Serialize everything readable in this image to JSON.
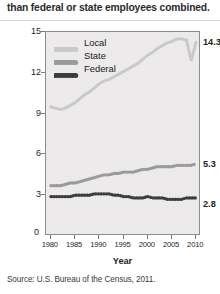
{
  "header": {
    "text": "than federal or state employees combined."
  },
  "source": {
    "text": "Source: U.S. Bureau of the Census, 2011."
  },
  "legend": {
    "items": [
      {
        "label": "Local",
        "color": "#c9c9c9"
      },
      {
        "label": "State",
        "color": "#9a9a9a"
      },
      {
        "label": "Federal",
        "color": "#3d3d3d"
      }
    ]
  },
  "axes": {
    "y_label": "Number of Employees (in millions)",
    "x_label": "Year",
    "y_ticks": [
      "15",
      "12",
      "9",
      "6",
      "3"
    ],
    "zero_label": "0",
    "x_ticks": [
      "1980",
      "1985",
      "1990",
      "1995",
      "2000",
      "2005",
      "2010"
    ]
  },
  "end_labels": {
    "local": "14.3",
    "state": "5.3",
    "federal": "2.8"
  },
  "colors": {
    "plot_background": "#eceaea",
    "plot_border": "#8d8d8d",
    "local": "#c9c9c9",
    "state": "#9a9a9a",
    "federal": "#3d3d3d",
    "page_background": "#ffffff",
    "text": "#231f20"
  },
  "chart_data": {
    "type": "line",
    "title": "",
    "xlabel": "Year",
    "ylabel": "Number of Employees (in millions)",
    "xlim": [
      1979,
      2011
    ],
    "ylim": [
      0,
      15
    ],
    "y_ticks": [
      3,
      6,
      9,
      12,
      15
    ],
    "x_ticks": [
      1980,
      1985,
      1990,
      1995,
      2000,
      2005,
      2010
    ],
    "grid": false,
    "legend_position": "top-left-inside",
    "marker": "dotted-circles",
    "x": [
      1980,
      1981,
      1982,
      1983,
      1984,
      1985,
      1986,
      1987,
      1988,
      1989,
      1990,
      1991,
      1992,
      1993,
      1994,
      1995,
      1996,
      1997,
      1998,
      1999,
      2000,
      2001,
      2002,
      2003,
      2004,
      2005,
      2006,
      2007,
      2008,
      2009,
      2010
    ],
    "series": [
      {
        "name": "Local",
        "color": "#c9c9c9",
        "end_label": "14.3",
        "values": [
          9.5,
          9.4,
          9.3,
          9.4,
          9.6,
          9.8,
          10.1,
          10.4,
          10.6,
          10.9,
          11.2,
          11.4,
          11.5,
          11.7,
          11.9,
          12.1,
          12.3,
          12.5,
          12.7,
          13.0,
          13.3,
          13.5,
          13.8,
          14.0,
          14.2,
          14.3,
          14.5,
          14.5,
          14.4,
          12.9,
          14.3
        ]
      },
      {
        "name": "State",
        "color": "#9a9a9a",
        "end_label": "5.3",
        "values": [
          3.7,
          3.7,
          3.7,
          3.8,
          3.9,
          3.9,
          4.0,
          4.1,
          4.2,
          4.3,
          4.4,
          4.5,
          4.5,
          4.6,
          4.6,
          4.7,
          4.7,
          4.7,
          4.8,
          4.9,
          4.9,
          5.0,
          5.1,
          5.1,
          5.1,
          5.1,
          5.2,
          5.2,
          5.2,
          5.2,
          5.3
        ]
      },
      {
        "name": "Federal",
        "color": "#3d3d3d",
        "end_label": "2.8",
        "values": [
          2.9,
          2.9,
          2.9,
          2.9,
          2.9,
          3.0,
          3.0,
          3.0,
          3.0,
          3.1,
          3.1,
          3.1,
          3.1,
          3.0,
          3.0,
          2.9,
          2.9,
          2.8,
          2.8,
          2.8,
          2.9,
          2.8,
          2.8,
          2.8,
          2.7,
          2.7,
          2.7,
          2.7,
          2.8,
          2.8,
          2.8
        ]
      }
    ]
  }
}
